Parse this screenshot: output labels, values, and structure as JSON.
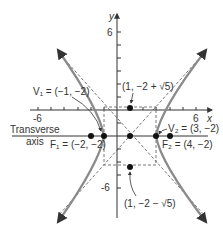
{
  "diagram": {
    "type": "hyperbola",
    "axes": {
      "x_label": "x",
      "y_label": "y",
      "x_ticks": [
        "-6",
        "6"
      ],
      "y_ticks": [
        "6",
        "-6"
      ]
    },
    "labels": {
      "transverse_line1": "Transverse",
      "transverse_line2": "axis",
      "v1": "V₁ = (−1, −2)",
      "v2": "V₂ = (3, −2)",
      "f1": "F₁ = (−2, −2)",
      "f2": "F₂ = (4, −2)",
      "top_point": "(1, −2 + √5)",
      "bottom_point": "(1, −2 − √5)"
    },
    "points": {
      "center": [
        1,
        -2
      ],
      "v1": [
        -1,
        -2
      ],
      "v2": [
        3,
        -2
      ],
      "f1": [
        -2,
        -2
      ],
      "f2": [
        4,
        -2
      ],
      "top": [
        1,
        0.236
      ],
      "bottom": [
        1,
        -4.236
      ]
    },
    "colors": {
      "curve": "#8a8a8a",
      "axis": "#333333",
      "dashed": "#555555"
    }
  }
}
